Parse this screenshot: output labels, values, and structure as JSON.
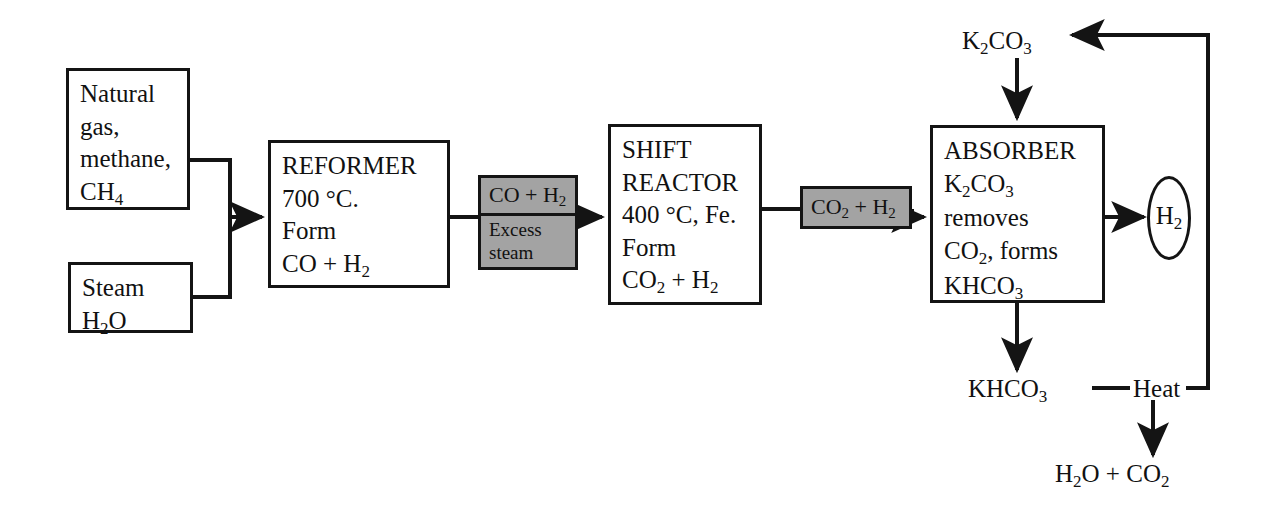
{
  "diagram": {
    "stroke_color": "#141414",
    "gray_fill": "#a3a3a3",
    "background": "#ffffff"
  },
  "nodes": {
    "feed_gas": {
      "label": "Natural gas, methane, CH4",
      "lines": [
        "Natural",
        "gas,",
        "methane,",
        "CH",
        "4"
      ],
      "line1": "Natural",
      "line2": "gas,",
      "line3": "methane,",
      "line4_main": "CH",
      "line4_sub": "4"
    },
    "feed_steam": {
      "label": "Steam H2O",
      "line1": "Steam",
      "line2_a": "H",
      "line2_sub": "2",
      "line2_b": "O"
    },
    "reformer": {
      "title": "REFORMER",
      "temperature": "700 °C.",
      "action": "Form",
      "product_main": "CO + H",
      "product_sub": "2"
    },
    "shift_reactor": {
      "title_line1": "SHIFT",
      "title_line2": "REACTOR",
      "conditions": "400 °C, Fe.",
      "action": "Form",
      "product_main_a": "CO",
      "product_sub_a": "2",
      "product_main_b": " + H",
      "product_sub_b": "2"
    },
    "absorber": {
      "title": "ABSORBER",
      "reagent_main": "K",
      "reagent_sub1": "2",
      "reagent_mid": "CO",
      "reagent_sub2": "3",
      "action": "removes",
      "removed_main": "CO",
      "removed_sub": "2",
      "removed_rest": ", forms",
      "product_main": "KHCO",
      "product_sub": "3"
    },
    "stream_co_h2": {
      "top_main": "CO + H",
      "top_sub": "2",
      "bottom_line1": "Excess",
      "bottom_line2": "steam"
    },
    "stream_co2_h2": {
      "main_a": "CO",
      "sub_a": "2",
      "main_b": " + H",
      "sub_b": "2"
    },
    "hydrogen_product": {
      "main": "H",
      "sub": "2"
    }
  },
  "labels": {
    "potassium_carbonate_feed": {
      "main_a": "K",
      "sub_a": "2",
      "main_b": "CO",
      "sub_b": "3"
    },
    "bicarbonate_out": {
      "main": "KHCO",
      "sub": "3"
    },
    "heat": "Heat",
    "regeneration_products": {
      "main_a": "H",
      "sub_a": "2",
      "main_b": "O + CO",
      "sub_b": "2"
    }
  },
  "flows": [
    {
      "name": "feed-gas-to-junction",
      "from": "feed_gas",
      "to": "reformer"
    },
    {
      "name": "feed-steam-to-junction",
      "from": "feed_steam",
      "to": "reformer"
    },
    {
      "name": "reformer-to-shift",
      "from": "reformer",
      "to": "shift_reactor",
      "stream": "stream_co_h2"
    },
    {
      "name": "shift-to-absorber",
      "from": "shift_reactor",
      "to": "absorber",
      "stream": "stream_co2_h2"
    },
    {
      "name": "absorber-to-hydrogen",
      "from": "absorber",
      "to": "hydrogen_product"
    },
    {
      "name": "carbonate-feed-to-absorber",
      "from": "potassium_carbonate_feed",
      "to": "absorber"
    },
    {
      "name": "absorber-to-bicarbonate",
      "from": "absorber",
      "to": "bicarbonate_out"
    },
    {
      "name": "heat-to-regeneration-products",
      "from": "heat",
      "to": "regeneration_products"
    },
    {
      "name": "heat-recycle-to-carbonate",
      "from": "heat",
      "to": "potassium_carbonate_feed"
    }
  ]
}
